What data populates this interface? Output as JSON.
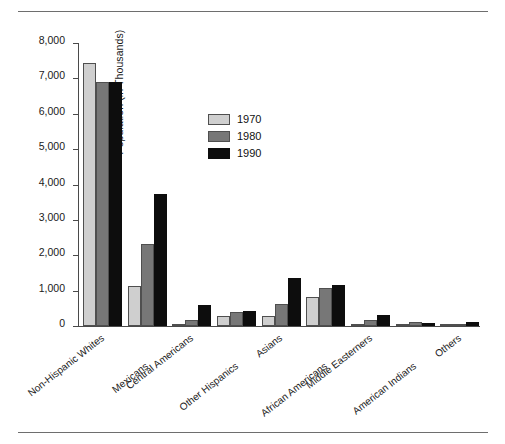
{
  "figure": {
    "has_top_rule": true,
    "has_bottom_rule": true
  },
  "chart_data": {
    "type": "bar",
    "title": "",
    "subtitle": "",
    "xlabel": "",
    "ylabel": "Population (in Thousands)",
    "ylim": [
      0,
      8000
    ],
    "yticks": [
      0,
      1000,
      2000,
      3000,
      4000,
      5000,
      6000,
      7000,
      8000
    ],
    "ytick_labels": [
      "0",
      "1,000",
      "2,000",
      "3,000",
      "4,000",
      "5,000",
      "6,000",
      "7,000",
      "8,000"
    ],
    "grid": false,
    "legend_position": "inside-upper-center",
    "categories": [
      "Non-Hispanic Whites",
      "Mexicans",
      "Central Americans",
      "Other Hispanics",
      "Asians",
      "African Americans",
      "Middle Easterners",
      "American Indians",
      "Others"
    ],
    "series": [
      {
        "name": "1970",
        "color": "#cfcfcf",
        "values": [
          7430,
          1130,
          30,
          280,
          270,
          830,
          40,
          60,
          20
        ]
      },
      {
        "name": "1980",
        "color": "#777777",
        "values": [
          6890,
          2320,
          170,
          410,
          620,
          1080,
          170,
          100,
          20
        ]
      },
      {
        "name": "1990",
        "color": "#0d0d0d",
        "values": [
          6900,
          3740,
          600,
          420,
          1350,
          1150,
          320,
          90,
          100
        ]
      }
    ]
  }
}
